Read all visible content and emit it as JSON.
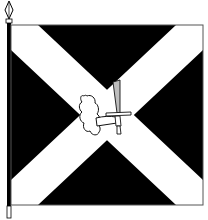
{
  "title": "Flag with saltire and cloud-arm holding sword",
  "colors": {
    "field": "#000000",
    "saltire": "#ffffff",
    "outline": "#555555",
    "pole": "#000000",
    "emblem_fill": "#ffffff",
    "emblem_stroke": "#111111",
    "blade": "#bdbdbd"
  },
  "flag": {
    "type": "saltire",
    "emblem": "cloud-arm-holding-sword"
  },
  "pole": {
    "finial": "spearhead"
  }
}
